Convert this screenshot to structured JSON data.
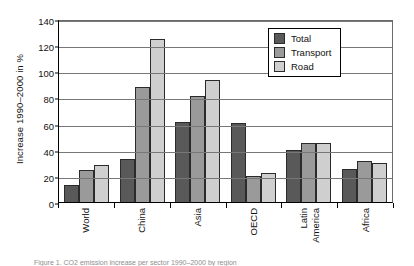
{
  "chart_data": {
    "type": "bar",
    "title": "",
    "xlabel": "",
    "ylabel": "Increase 1990–2000 in %",
    "ylim": [
      0,
      140
    ],
    "yticks": [
      0,
      20,
      40,
      60,
      80,
      100,
      120,
      140
    ],
    "grid": true,
    "legend_position": "top-right",
    "categories": [
      "World",
      "China",
      "Asia",
      "OECD",
      "Latin America",
      "Africa"
    ],
    "category_lines": [
      [
        "World"
      ],
      [
        "China"
      ],
      [
        "Asia"
      ],
      [
        "OECD"
      ],
      [
        "Latin",
        "America"
      ],
      [
        "Africa"
      ]
    ],
    "series": [
      {
        "name": "Total",
        "color": "#595959",
        "values": [
          13,
          33,
          61,
          60.5,
          40,
          25
        ]
      },
      {
        "name": "Transport",
        "color": "#9a9a9a",
        "values": [
          24.5,
          88,
          81,
          20,
          45,
          31
        ]
      },
      {
        "name": "Road",
        "color": "#cfcfcf",
        "values": [
          28,
          125,
          93.5,
          22,
          45,
          30
        ]
      }
    ]
  },
  "caption": "Figure 1. CO2 emission increase per sector 1990–2000 by region"
}
